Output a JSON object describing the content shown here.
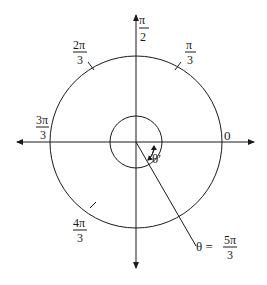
{
  "diagram": {
    "type": "unit-circle-angle",
    "colors": {
      "stroke": "#1a1a1a",
      "background": "#ffffff"
    },
    "labels": {
      "zero": "0",
      "pi_over_2_num": "π",
      "pi_over_2_den": "2",
      "pi_over_3_num": "π",
      "pi_over_3_den": "3",
      "two_pi_over_3_num": "2π",
      "two_pi_over_3_den": "3",
      "three_pi_over_3_num": "3π",
      "three_pi_over_3_den": "3",
      "four_pi_over_3_num": "4π",
      "four_pi_over_3_den": "3",
      "theta_prime": "θ′",
      "theta_eq": "θ =",
      "theta_num": "5π",
      "theta_den": "3"
    }
  }
}
